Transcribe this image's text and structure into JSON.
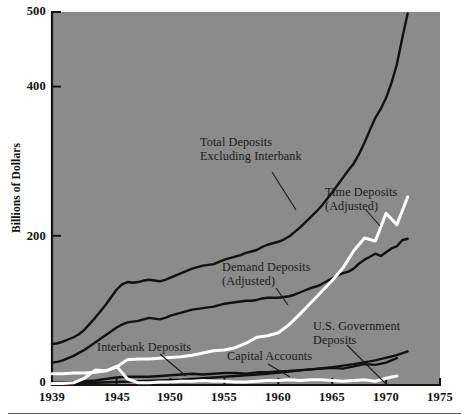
{
  "chart_data": {
    "type": "line",
    "title": "",
    "xlabel": "",
    "ylabel": "Billions of Dollars",
    "xlim": [
      1939,
      1975
    ],
    "ylim": [
      0,
      500
    ],
    "grid": false,
    "legend_position": "inline-annotations",
    "background_color": "#8b8b8b",
    "xticks": [
      1939,
      1945,
      1950,
      1955,
      1960,
      1965,
      1970,
      1975
    ],
    "xtick_labels": [
      "1939",
      "1945",
      "1950",
      "1955",
      "1960",
      "1965",
      "1970",
      "1975"
    ],
    "yticks": [
      0,
      200,
      400,
      500
    ],
    "ytick_labels": [
      "0",
      "200",
      "400",
      "500"
    ],
    "series": [
      {
        "name": "Total Deposits Excluding Interbank",
        "color": "#111111",
        "label_line1": "Total Deposits",
        "label_line2": "Excluding Interbank",
        "x": [
          1939,
          1939.5,
          1940,
          1940.5,
          1941,
          1941.5,
          1942,
          1942.5,
          1943,
          1943.5,
          1944,
          1944.5,
          1945,
          1945.5,
          1946,
          1946.5,
          1947,
          1947.5,
          1948,
          1948.5,
          1949,
          1949.5,
          1950,
          1950.5,
          1951,
          1951.5,
          1952,
          1952.5,
          1953,
          1953.5,
          1954,
          1954.5,
          1955,
          1955.5,
          1956,
          1956.5,
          1957,
          1957.5,
          1958,
          1958.5,
          1959,
          1959.5,
          1960,
          1960.5,
          1961,
          1961.5,
          1962,
          1962.5,
          1963,
          1963.5,
          1964,
          1964.5,
          1965,
          1965.5,
          1966,
          1966.5,
          1967,
          1967.5,
          1968,
          1968.5,
          1969,
          1969.5,
          1970,
          1970.5,
          1971,
          1971.5,
          1972
        ],
        "y": [
          55,
          56,
          58,
          61,
          64,
          68,
          74,
          82,
          90,
          99,
          108,
          118,
          128,
          135,
          138,
          137,
          138,
          140,
          141,
          140,
          139,
          141,
          144,
          147,
          150,
          153,
          156,
          158,
          160,
          161,
          162,
          165,
          168,
          170,
          172,
          174,
          177,
          179,
          181,
          185,
          188,
          190,
          192,
          195,
          199,
          205,
          211,
          218,
          225,
          232,
          240,
          249,
          258,
          268,
          278,
          288,
          297,
          310,
          325,
          342,
          358,
          370,
          385,
          405,
          430,
          465,
          498
        ]
      },
      {
        "name": "Demand Deposits (Adjusted)",
        "color": "#111111",
        "label_line1": "Demand Deposits",
        "label_line2": "(Adjusted)",
        "x": [
          1939,
          1939.5,
          1940,
          1940.5,
          1941,
          1941.5,
          1942,
          1942.5,
          1943,
          1943.5,
          1944,
          1944.5,
          1945,
          1945.5,
          1946,
          1946.5,
          1947,
          1947.5,
          1948,
          1948.5,
          1949,
          1949.5,
          1950,
          1950.5,
          1951,
          1951.5,
          1952,
          1952.5,
          1953,
          1953.5,
          1954,
          1954.5,
          1955,
          1955.5,
          1956,
          1956.5,
          1957,
          1957.5,
          1958,
          1958.5,
          1959,
          1959.5,
          1960,
          1960.5,
          1961,
          1961.5,
          1962,
          1962.5,
          1963,
          1963.5,
          1964,
          1964.5,
          1965,
          1965.5,
          1966,
          1966.5,
          1967,
          1967.5,
          1968,
          1968.5,
          1969,
          1969.5,
          1970,
          1970.5,
          1971,
          1971.5,
          1972
        ],
        "y": [
          30,
          31,
          33,
          36,
          39,
          43,
          47,
          52,
          57,
          62,
          67,
          72,
          77,
          81,
          84,
          85,
          86,
          88,
          90,
          89,
          88,
          90,
          93,
          95,
          97,
          99,
          101,
          102,
          103,
          104,
          105,
          107,
          109,
          110,
          111,
          112,
          113,
          113,
          114,
          116,
          117,
          117,
          117,
          118,
          119,
          121,
          124,
          127,
          130,
          132,
          135,
          139,
          143,
          147,
          150,
          152,
          156,
          163,
          168,
          172,
          176,
          173,
          178,
          183,
          186,
          194,
          196
        ]
      },
      {
        "name": "Time Deposits (Adjusted)",
        "color": "#ffffff",
        "label_line1": "Time Deposits",
        "label_line2": "(Adjusted)",
        "x": [
          1939,
          1940,
          1941,
          1942,
          1943,
          1944,
          1945,
          1946,
          1947,
          1948,
          1949,
          1950,
          1951,
          1952,
          1953,
          1954,
          1955,
          1956,
          1957,
          1958,
          1959,
          1960,
          1961,
          1962,
          1963,
          1964,
          1965,
          1966,
          1967,
          1968,
          1969,
          1970,
          1971,
          1972
        ],
        "y": [
          15,
          15,
          16,
          16,
          17,
          19,
          24,
          34,
          35,
          35,
          36,
          37,
          38,
          40,
          43,
          46,
          47,
          50,
          56,
          64,
          66,
          70,
          81,
          95,
          110,
          125,
          140,
          157,
          180,
          197,
          193,
          230,
          215,
          252
        ]
      },
      {
        "name": "Interbank Deposits",
        "color": "#111111",
        "label_line1": "Interbank Deposits",
        "label_line2": "",
        "x": [
          1939,
          1940,
          1941,
          1942,
          1943,
          1944,
          1945,
          1946,
          1947,
          1948,
          1949,
          1950,
          1951,
          1952,
          1953,
          1954,
          1955,
          1956,
          1957,
          1958,
          1959,
          1960,
          1961,
          1962,
          1963,
          1964,
          1965,
          1966,
          1967,
          1968,
          1969,
          1970,
          1971
        ],
        "y": [
          3,
          3,
          4,
          5,
          6,
          8,
          10,
          11,
          11,
          11,
          12,
          13,
          14,
          15,
          14,
          15,
          16,
          16,
          15,
          17,
          17,
          18,
          19,
          20,
          21,
          22,
          23,
          22,
          25,
          28,
          27,
          30,
          36
        ]
      },
      {
        "name": "Capital Accounts",
        "color": "#111111",
        "label_line1": "Capital Accounts",
        "label_line2": "",
        "x": [
          1939,
          1941,
          1943,
          1945,
          1947,
          1949,
          1951,
          1953,
          1955,
          1957,
          1959,
          1961,
          1963,
          1965,
          1967,
          1969,
          1971,
          1972
        ],
        "y": [
          2,
          2,
          3,
          4,
          5,
          6,
          7,
          9,
          11,
          13,
          15,
          18,
          21,
          24,
          28,
          33,
          40,
          45
        ]
      },
      {
        "name": "U.S. Government Deposits",
        "color": "#ffffff",
        "label_line1": "U.S. Government",
        "label_line2": "Deposits",
        "x": [
          1939,
          1940,
          1941,
          1942,
          1943,
          1944,
          1945,
          1946,
          1947,
          1948,
          1949,
          1950,
          1951,
          1952,
          1953,
          1954,
          1955,
          1956,
          1957,
          1958,
          1959,
          1960,
          1961,
          1962,
          1963,
          1964,
          1965,
          1966,
          1967,
          1968,
          1969,
          1970,
          1971
        ],
        "y": [
          2,
          2,
          3,
          9,
          20,
          19,
          25,
          8,
          3,
          3,
          4,
          4,
          5,
          5,
          6,
          5,
          5,
          4,
          4,
          5,
          6,
          6,
          7,
          6,
          7,
          7,
          6,
          5,
          6,
          7,
          5,
          9,
          12
        ]
      }
    ]
  },
  "axes": {
    "ylabel": "Billions of Dollars",
    "yticks": [
      {
        "value": 500,
        "label": "500"
      },
      {
        "value": 400,
        "label": "400"
      },
      {
        "value": 200,
        "label": "200"
      },
      {
        "value": 0,
        "label": "0"
      }
    ],
    "xticks": [
      {
        "value": 1939,
        "label": "1939"
      },
      {
        "value": 1945,
        "label": "1945"
      },
      {
        "value": 1950,
        "label": "1950"
      },
      {
        "value": 1955,
        "label": "1955"
      },
      {
        "value": 1960,
        "label": "1960"
      },
      {
        "value": 1965,
        "label": "1965"
      },
      {
        "value": 1970,
        "label": "1970"
      },
      {
        "value": 1975,
        "label": "1975"
      }
    ]
  },
  "annotations": {
    "total_deposits_l1": "Total Deposits",
    "total_deposits_l2": "Excluding Interbank",
    "time_deposits_l1": "Time Deposits",
    "time_deposits_l2": "(Adjusted)",
    "demand_deposits_l1": "Demand Deposits",
    "demand_deposits_l2": "(Adjusted)",
    "us_government_l1": "U.S. Government",
    "us_government_l2": "Deposits",
    "interbank_deposits": "Interbank Deposits",
    "capital_accounts": "Capital Accounts"
  },
  "colors": {
    "plot_background": "#8b8b8b",
    "line_dark": "#111111",
    "line_light": "#ffffff",
    "text": "#111111"
  }
}
